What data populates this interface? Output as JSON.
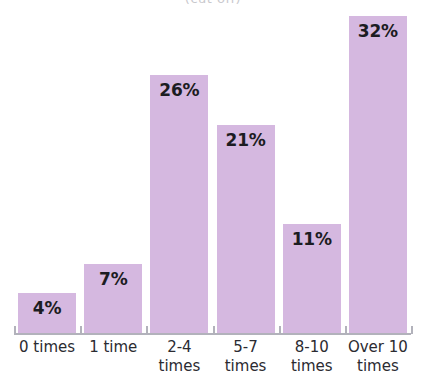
{
  "chart_data": {
    "type": "bar",
    "title": "(cut off)",
    "subtitle": "",
    "xlabel": "",
    "ylabel": "",
    "ylim": [
      0,
      33
    ],
    "grid": false,
    "legend": "none",
    "orientation": "vertical",
    "bar_color": "#d5b8e0",
    "axis_color": "#b2b2bb",
    "label_color": "#1c1c22",
    "categories": [
      "0 times",
      "1 time",
      "2-4 times",
      "5-7 times",
      "8-10 times",
      "Over 10 times"
    ],
    "category_lines": [
      [
        "0 times"
      ],
      [
        "1 time"
      ],
      [
        "2-4",
        "times"
      ],
      [
        "5-7",
        "times"
      ],
      [
        "8-10",
        "times"
      ],
      [
        "Over 10",
        "times"
      ]
    ],
    "values": [
      4,
      7,
      26,
      21,
      11,
      32
    ],
    "value_labels": [
      "4%",
      "7%",
      "26%",
      "21%",
      "11%",
      "32%"
    ]
  }
}
